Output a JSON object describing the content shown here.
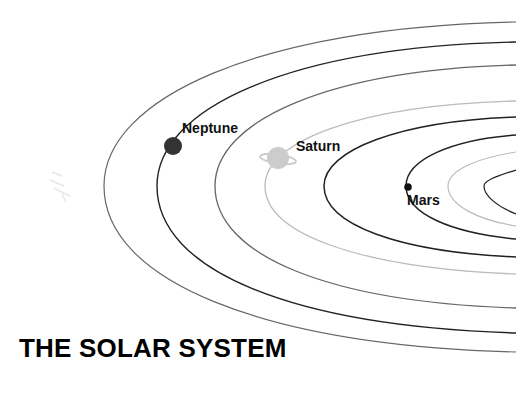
{
  "title": "THE SOLAR SYSTEM",
  "colors": {
    "background": "#ffffff",
    "text": "#111111",
    "orbit_dark": "#222222",
    "orbit_mid": "#666666",
    "orbit_light": "#bbbbbb",
    "neptune": "#333333",
    "saturn": "#cccccc",
    "mars": "#111111"
  },
  "orbits": [
    {
      "name": "orbit-1",
      "tone": "orbit_dark"
    },
    {
      "name": "orbit-2",
      "tone": "orbit_light"
    },
    {
      "name": "orbit-3-mars",
      "tone": "orbit_dark"
    },
    {
      "name": "orbit-4",
      "tone": "orbit_dark"
    },
    {
      "name": "orbit-5-saturn",
      "tone": "orbit_light"
    },
    {
      "name": "orbit-6",
      "tone": "orbit_mid"
    },
    {
      "name": "orbit-7-neptune",
      "tone": "orbit_dark"
    },
    {
      "name": "orbit-8",
      "tone": "orbit_mid"
    }
  ],
  "planets": [
    {
      "name": "Neptune",
      "label": "Neptune",
      "icon": "planet-dot-icon"
    },
    {
      "name": "Saturn",
      "label": "Saturn",
      "icon": "ringed-planet-icon"
    },
    {
      "name": "Mars",
      "label": "Mars",
      "icon": "planet-dot-icon"
    }
  ],
  "decoration": {
    "faint_object": "comet-icon"
  }
}
